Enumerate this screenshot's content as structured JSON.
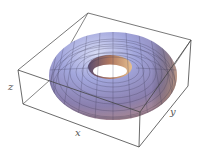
{
  "figure": {
    "type": "3D surface plot",
    "surface": "torus",
    "mesh": true,
    "bounding_box": true
  },
  "axes": {
    "x_label": "x",
    "y_label": "y",
    "z_label": "z"
  },
  "colors": {
    "box_line": "#555555",
    "torus_light": "#c8cdf0",
    "torus_blue": "#8a8fc8",
    "torus_shadow": "#6d5c8a",
    "torus_warm": "#d9a27a",
    "mesh_line": "#3a3650"
  }
}
